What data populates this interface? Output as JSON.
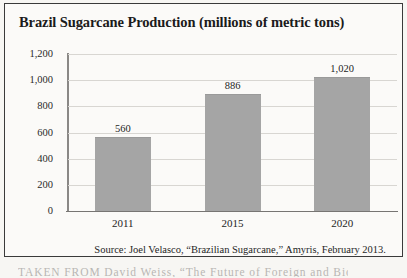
{
  "figure": {
    "title": "Brazil Sugarcane Production (millions of metric tons)",
    "source_note": "Source: Joel Velasco, “Brazilian Sugarcane,” Amyris, February 2013.",
    "cutoff_text_below": "TAKEN FROM David Weiss, “The Future of Foreign and Biofuel"
  },
  "style": {
    "bar_color": "#a5a5a5",
    "gridline_color": "#d8d6d2",
    "axis_color": "#8a8886",
    "text_color": "#1f1f1f",
    "page_background": "#f7f6f3"
  },
  "chart_data": {
    "type": "bar",
    "title": "Brazil Sugarcane Production (millions of metric tons)",
    "xlabel": "",
    "ylabel": "",
    "categories": [
      "2011",
      "2015",
      "2020"
    ],
    "values": [
      560,
      886,
      1020
    ],
    "value_labels": [
      "560",
      "886",
      "1,020"
    ],
    "ylim": [
      0,
      1200
    ],
    "ytick_values": [
      0,
      200,
      400,
      600,
      800,
      1000,
      1200
    ],
    "ytick_labels": [
      "0",
      "200",
      "400",
      "600",
      "800",
      "1,000",
      "1,200"
    ],
    "grid": true,
    "legend": false,
    "series": [
      {
        "name": "Sugarcane production",
        "units": "millions of metric tons",
        "values": [
          560,
          886,
          1020
        ]
      }
    ]
  }
}
